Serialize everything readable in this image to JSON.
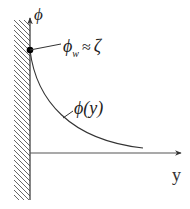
{
  "diagram": {
    "vertical_axis_label": "ϕ",
    "horizontal_axis_label": "y",
    "wall_value_label": {
      "symbol": "ϕ",
      "subscript": "w",
      "relation": "≈",
      "value": "ζ"
    },
    "curve_label": "ϕ(y)",
    "colors": {
      "line": "#333333",
      "curve": "#333333",
      "dot": "#000000",
      "hatch": "#555555"
    }
  }
}
